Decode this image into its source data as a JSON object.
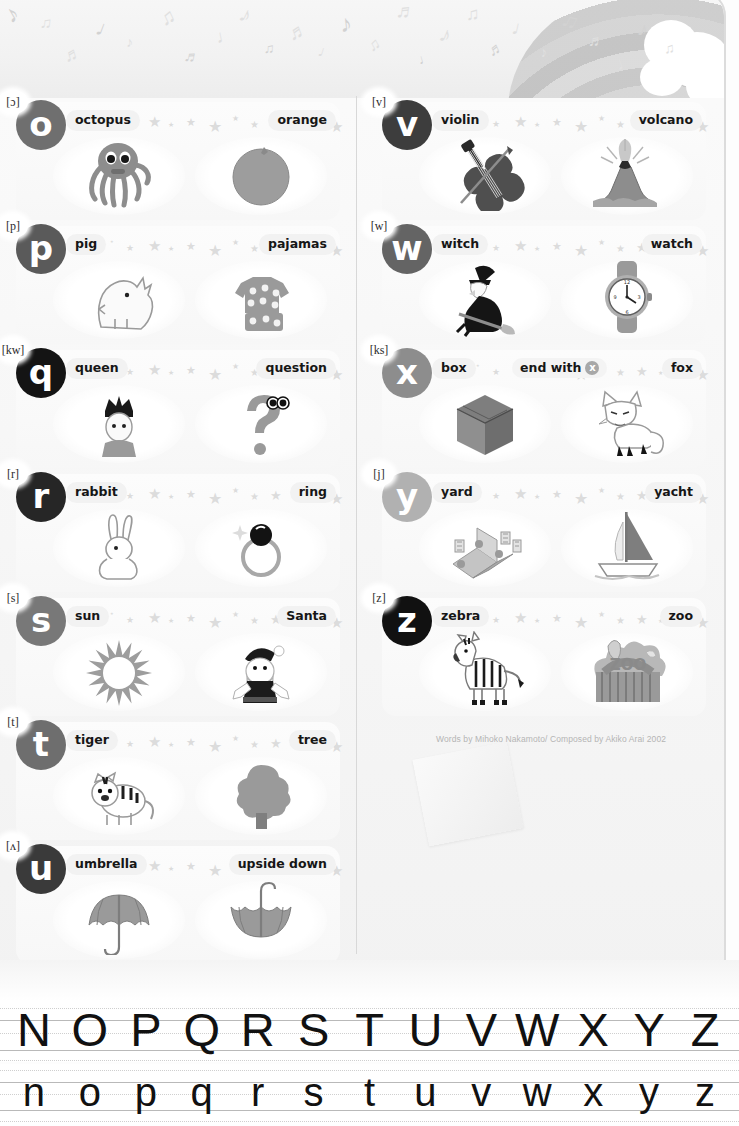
{
  "page": {
    "credit": "Words by Mihoko Nakamoto/ Composed by Akiko Arai 2002"
  },
  "colors": {
    "page_bg": "#fdfdfd",
    "card_bg": "#f7f7f7",
    "label_bg": "#f2f2f2",
    "star": "#dcdcdc",
    "text": "#161616",
    "credit_text": "#b4b4b4"
  },
  "rows": {
    "left": [
      {
        "phonetic": "[ɔ]",
        "letter": "o",
        "letter_color": "#6f6f6f",
        "word1": "octopus",
        "word2": "orange",
        "icon1": "octopus-icon",
        "icon2": "orange-icon"
      },
      {
        "phonetic": "[p]",
        "letter": "p",
        "letter_color": "#5a5a5a",
        "word1": "pig",
        "word2": "pajamas",
        "icon1": "pig-icon",
        "icon2": "pajamas-icon"
      },
      {
        "phonetic": "[kw]",
        "letter": "q",
        "letter_color": "#141414",
        "word1": "queen",
        "word2": "question",
        "icon1": "queen-icon",
        "icon2": "question-mark-icon"
      },
      {
        "phonetic": "[r]",
        "letter": "r",
        "letter_color": "#262626",
        "word1": "rabbit",
        "word2": "ring",
        "icon1": "rabbit-icon",
        "icon2": "ring-icon"
      },
      {
        "phonetic": "[s]",
        "letter": "s",
        "letter_color": "#787878",
        "word1": "sun",
        "word2": "Santa",
        "icon1": "sun-icon",
        "icon2": "santa-icon"
      },
      {
        "phonetic": "[t]",
        "letter": "t",
        "letter_color": "#6e6e6e",
        "word1": "tiger",
        "word2": "tree",
        "icon1": "tiger-icon",
        "icon2": "tree-icon"
      },
      {
        "phonetic": "[ʌ]",
        "letter": "u",
        "letter_color": "#3a3a3a",
        "word1": "umbrella",
        "word2": "upside down",
        "icon1": "umbrella-icon",
        "icon2": "upside-down-umbrella-icon"
      }
    ],
    "right": [
      {
        "phonetic": "[v]",
        "letter": "v",
        "letter_color": "#3d3d3d",
        "word1": "violin",
        "word2": "volcano",
        "icon1": "violin-icon",
        "icon2": "volcano-icon"
      },
      {
        "phonetic": "[w]",
        "letter": "w",
        "letter_color": "#646464",
        "word1": "witch",
        "word2": "watch",
        "icon1": "witch-icon",
        "icon2": "watch-icon"
      },
      {
        "phonetic": "[ks]",
        "letter": "x",
        "letter_color": "#8d8d8d",
        "word1": "box",
        "word2": "fox",
        "midnote": "end with",
        "midnote_badge": "x",
        "icon1": "box-icon",
        "icon2": "fox-icon"
      },
      {
        "phonetic": "[j]",
        "letter": "y",
        "letter_color": "#b1b1b1",
        "word1": "yard",
        "word2": "yacht",
        "icon1": "yard-icon",
        "icon2": "yacht-icon"
      },
      {
        "phonetic": "[z]",
        "letter": "z",
        "letter_color": "#111111",
        "word1": "zebra",
        "word2": "zoo",
        "icon1": "zebra-icon",
        "icon2": "zoo-icon"
      }
    ]
  },
  "practice": {
    "uppercase": [
      "N",
      "O",
      "P",
      "Q",
      "R",
      "S",
      "T",
      "U",
      "V",
      "W",
      "X",
      "Y",
      "Z"
    ],
    "lowercase": [
      "n",
      "o",
      "p",
      "q",
      "r",
      "s",
      "t",
      "u",
      "v",
      "w",
      "x",
      "y",
      "z"
    ]
  },
  "banner": {
    "decor": "music-notes-rainbow-cloud"
  }
}
